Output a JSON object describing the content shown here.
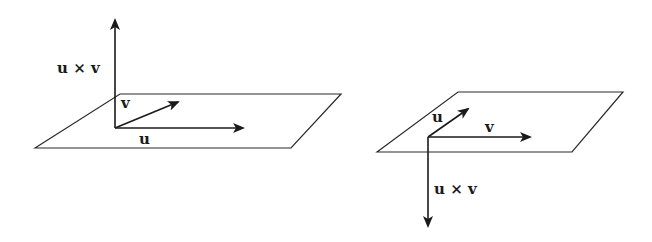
{
  "figure": {
    "left_diagram": {
      "labels": {
        "cross": "u × v",
        "u": "u",
        "v": "v"
      },
      "cross_direction": "up"
    },
    "right_diagram": {
      "labels": {
        "cross": "u × v",
        "u": "u",
        "v": "v"
      },
      "cross_direction": "down"
    },
    "colors": {
      "ink": "#1a1a1a",
      "background": "#ffffff"
    }
  }
}
